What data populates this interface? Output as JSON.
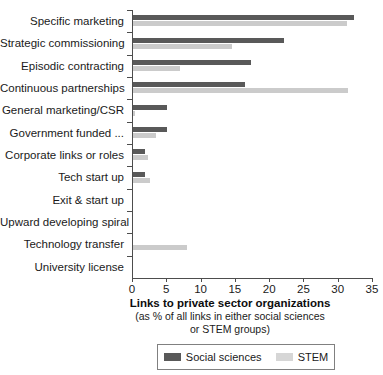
{
  "chart_data": {
    "type": "bar",
    "orientation": "horizontal",
    "title": "",
    "xlabel": "Links to private sector organizations",
    "xlabel_sub_line1": "(as % of all links in either social sciences",
    "xlabel_sub_line2": "or STEM groups)",
    "ylabel": "",
    "xlim": [
      0,
      35
    ],
    "xticks": [
      0,
      5,
      10,
      15,
      20,
      25,
      30,
      35
    ],
    "grid": false,
    "legend_position": "bottom",
    "categories": [
      "Specific marketing",
      "Strategic commissioning",
      "Episodic contracting",
      "Continuous partnerships",
      "General marketing/CSR",
      "Government funded ...",
      "Corporate links or roles",
      "Tech start up",
      "Exit & start up",
      "Upward developing spiral",
      "Technology transfer",
      "University license"
    ],
    "series": [
      {
        "name": "Social sciences",
        "color": "#595959",
        "values": [
          32.2,
          22.0,
          17.2,
          16.4,
          4.9,
          5.0,
          1.8,
          1.8,
          0,
          0,
          0,
          0
        ]
      },
      {
        "name": "STEM",
        "color": "#cbcbcb",
        "values": [
          31.2,
          14.5,
          6.9,
          31.4,
          0.3,
          3.3,
          2.2,
          2.5,
          0,
          0,
          7.9,
          0
        ]
      }
    ]
  }
}
